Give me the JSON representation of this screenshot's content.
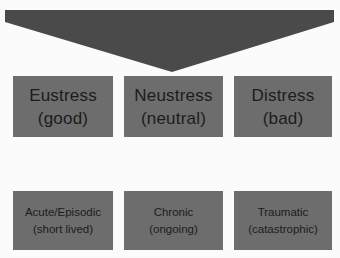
{
  "diagram": {
    "type": "stress-classification",
    "banner": {
      "shape": "downward-pointing-pentagon-arrow",
      "color": "#4a4a4a"
    },
    "colors": {
      "background": "#fbfbfb",
      "box_fill": "#6d6d6d",
      "text": "#1c1c1c"
    },
    "row1": [
      {
        "title": "Eustress",
        "subtitle": "(good)"
      },
      {
        "title": "Neustress",
        "subtitle": "(neutral)"
      },
      {
        "title": "Distress",
        "subtitle": "(bad)"
      }
    ],
    "row2": [
      {
        "title": "Acute/Episodic",
        "subtitle": "(short lived)"
      },
      {
        "title": "Chronic",
        "subtitle": "(ongoing)"
      },
      {
        "title": "Traumatic",
        "subtitle": "(catastrophic)"
      }
    ]
  }
}
